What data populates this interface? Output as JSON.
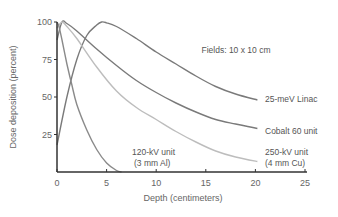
{
  "chart_data": {
    "type": "line",
    "title": "",
    "xlabel": "Depth (centimeters)",
    "ylabel": "Dose deposition (percent)",
    "xlim": [
      0,
      25
    ],
    "ylim": [
      0,
      100
    ],
    "xticks": [
      "0",
      "5",
      "10",
      "15",
      "20",
      "25"
    ],
    "yticks": [
      "25",
      "50",
      "75",
      "100"
    ],
    "grid": false,
    "legend": "inline labels",
    "annotation": "Fields: 10 x 10 cm",
    "series": [
      {
        "name": "25-meV Linac",
        "label_lines": [
          "25-meV Linac"
        ],
        "color": "#7a7a7a",
        "x": [
          0,
          1,
          2,
          3,
          4,
          4.5,
          5,
          6,
          8,
          10,
          12,
          14,
          16,
          18,
          20.2
        ],
        "y": [
          18,
          50,
          75,
          91,
          98,
          100,
          99.5,
          97,
          89,
          80,
          72,
          64,
          57,
          52,
          48
        ]
      },
      {
        "name": "Cobalt 60 unit",
        "label_lines": [
          "Cobalt 60 unit"
        ],
        "color": "#7a7a7a",
        "x": [
          0,
          0.5,
          1,
          2,
          4,
          6,
          8,
          10,
          12,
          14,
          16,
          18,
          20.2
        ],
        "y": [
          88,
          100,
          99,
          94,
          82,
          71,
          61,
          53,
          46,
          40,
          35,
          32,
          29
        ]
      },
      {
        "name": "250-kV unit (4 mm Cu)",
        "label_lines": [
          "250-kV unit",
          "(4 mm Cu)"
        ],
        "color": "#bdbdbd",
        "x": [
          0,
          0.5,
          1,
          2,
          4,
          6,
          8,
          10,
          12,
          14,
          16,
          18,
          20.2
        ],
        "y": [
          96,
          100,
          97,
          89,
          70,
          54,
          43,
          35,
          27,
          20,
          14,
          10,
          7
        ]
      },
      {
        "name": "120-kV unit (3 mm Al)",
        "label_lines": [
          "120-kV unit",
          "(3 mm Al)"
        ],
        "color": "#8a8a8a",
        "x": [
          0,
          0.2,
          0.5,
          1,
          1.5,
          2,
          3,
          4,
          5,
          6,
          6.5
        ],
        "y": [
          100,
          97,
          88,
          72,
          58,
          45,
          28,
          15,
          6,
          1,
          0
        ]
      }
    ]
  }
}
